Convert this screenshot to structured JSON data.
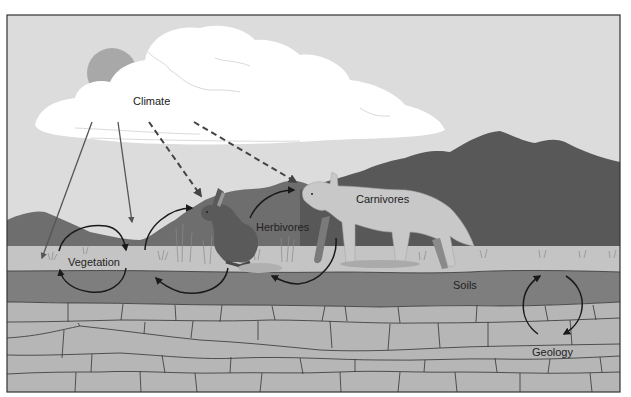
{
  "figure": {
    "type": "ecosystem-interactions-diagram",
    "labels": {
      "climate": "Climate",
      "vegetation": "Vegetation",
      "herbivores": "Herbivores",
      "carnivores": "Carnivores",
      "soils": "Soils",
      "geology": "Geology"
    },
    "colors": {
      "sky": "#dcdcdc",
      "cloud": "#ffffff",
      "sun": "#a8a8a8",
      "mountains_far": "#6e6e6e",
      "mountains_near": "#5e5e5e",
      "ground_surface": "#c2c2c2",
      "soil": "#7e7e7e",
      "bedrock": "#b5b5b5",
      "rock_lines": "#333333",
      "arrows": "#1a1a1a",
      "climate_solid_arrows": "#555555",
      "herbivore": "#5a5a5a",
      "carnivore": "#c8c8c8",
      "frame": "#333333"
    },
    "relationships": [
      {
        "from": "Climate",
        "to": "Vegetation",
        "style": "solid"
      },
      {
        "from": "Climate",
        "to": "Vegetation",
        "style": "solid"
      },
      {
        "from": "Climate",
        "to": "Herbivores",
        "style": "dashed"
      },
      {
        "from": "Climate",
        "to": "Carnivores",
        "style": "dashed"
      },
      {
        "from": "Vegetation",
        "to": "Soils",
        "style": "cycle"
      },
      {
        "from": "Herbivores",
        "to": "Vegetation",
        "style": "cycle"
      },
      {
        "from": "Herbivores",
        "to": "Carnivores",
        "style": "cycle"
      },
      {
        "from": "Soils",
        "to": "Geology",
        "style": "cycle"
      }
    ]
  }
}
